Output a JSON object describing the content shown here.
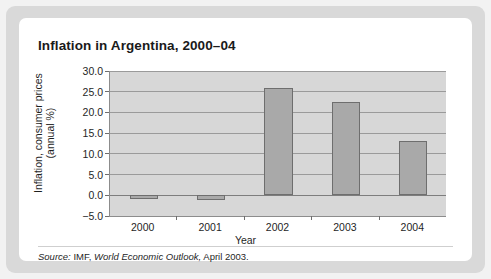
{
  "figure": {
    "title": "Inflation in Argentina, 2000–04",
    "source_prefix": "Source:",
    "source_agency": "IMF,",
    "source_publication": "World Economic Outlook,",
    "source_date": "April 2003."
  },
  "chart_data": {
    "type": "bar",
    "title": "Inflation in Argentina, 2000–04",
    "categories": [
      "2000",
      "2001",
      "2002",
      "2003",
      "2004"
    ],
    "values": [
      -0.9,
      -1.1,
      26.0,
      22.5,
      13.2
    ],
    "xlabel": "Year",
    "ylabel": "Inflation, consumer prices (annual %)",
    "ylabel_line1": "Inflation, consumer prices",
    "ylabel_line2": "(annual %)",
    "ylim": [
      -5.0,
      30.0
    ],
    "yticks": [
      "30.0",
      "25.0",
      "20.0",
      "15.0",
      "10.0",
      "5.0",
      "0.0",
      "−5.0"
    ],
    "ytick_values": [
      30.0,
      25.0,
      20.0,
      15.0,
      10.0,
      5.0,
      0.0,
      -5.0
    ],
    "grid": true,
    "legend": "none",
    "bar_color": "#a9a9a9",
    "bar_edge_color": "#6e6e6e",
    "plot_background": "#d7d7d7",
    "gridline_color": "#9a9a9a"
  }
}
